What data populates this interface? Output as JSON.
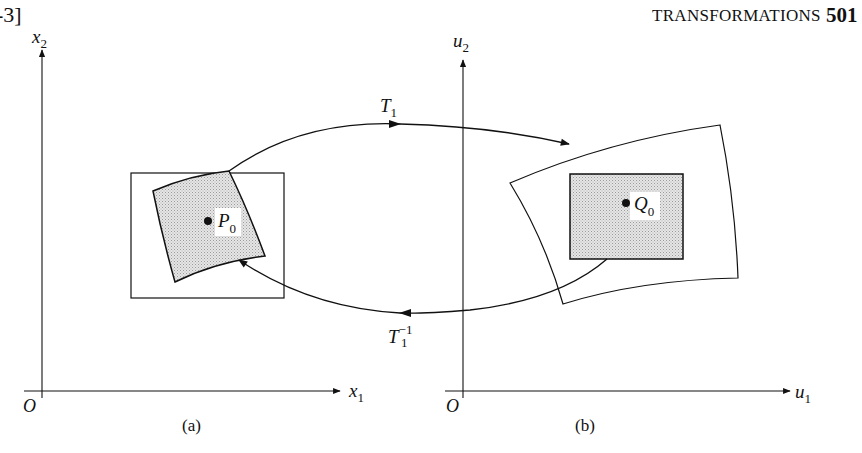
{
  "page": {
    "section_ref": "-3]",
    "running_title": "TRANSFORMATIONS",
    "page_number": "501"
  },
  "figure": {
    "panel_a": {
      "caption": "(a)",
      "origin_label": "O",
      "x_axis_label": "x",
      "x_axis_sub": "1",
      "y_axis_label": "x",
      "y_axis_sub": "2",
      "point_label": "P",
      "point_sub": "0"
    },
    "panel_b": {
      "caption": "(b)",
      "origin_label": "O",
      "x_axis_label": "u",
      "x_axis_sub": "1",
      "y_axis_label": "u",
      "y_axis_sub": "2",
      "point_label": "Q",
      "point_sub": "0"
    },
    "forward_map": {
      "label": "T",
      "sub": "1"
    },
    "inverse_map": {
      "label": "T",
      "sub": "1",
      "sup": "−1"
    },
    "colors": {
      "ink": "#111111",
      "shade": "#d9d9d9",
      "background": "#ffffff"
    }
  }
}
